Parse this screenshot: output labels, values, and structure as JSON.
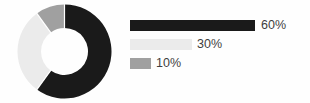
{
  "chart_data": {
    "type": "pie",
    "variant": "donut",
    "title": "",
    "subtitle": "",
    "xlabel": "",
    "ylabel": "",
    "grid": false,
    "legend_position": "right",
    "legend_style": "proportional-bars",
    "start_angle_deg": 0,
    "direction": "clockwise",
    "hole_fraction": 0.5,
    "categories": [
      "60%",
      "30%",
      "10%"
    ],
    "values": [
      60,
      30,
      10
    ],
    "value_unit": "%",
    "labels": [
      "60%",
      "30%",
      "10%"
    ],
    "colors": [
      "#1a1a1a",
      "#ebebeb",
      "#a0a0a0"
    ],
    "slices": [
      {
        "label": "60%",
        "value": 60,
        "color": "#1a1a1a",
        "start_deg": 0,
        "end_deg": 216
      },
      {
        "label": "30%",
        "value": 30,
        "color": "#ebebeb",
        "start_deg": 216,
        "end_deg": 324
      },
      {
        "label": "10%",
        "value": 10,
        "color": "#a0a0a0",
        "start_deg": 324,
        "end_deg": 360
      }
    ]
  },
  "donut": {
    "center_x": 47.5,
    "center_y": 47.5,
    "outer_radius": 47,
    "inner_radius": 23.5,
    "separator_color": "#ffffff",
    "separator_width": 1.2
  },
  "legend": {
    "max_bar_width": 125,
    "rows": [
      {
        "label": "60%",
        "value": 60,
        "color": "#1a1a1a",
        "bar_width": 125,
        "label_x": 131
      },
      {
        "label": "30%",
        "value": 30,
        "color": "#ebebeb",
        "bar_width": 62,
        "label_x": 67
      },
      {
        "label": "10%",
        "value": 10,
        "color": "#a0a0a0",
        "bar_width": 21,
        "label_x": 26
      }
    ]
  },
  "style": {
    "background": "#fefefe",
    "text_color": "#3f3f3f"
  }
}
